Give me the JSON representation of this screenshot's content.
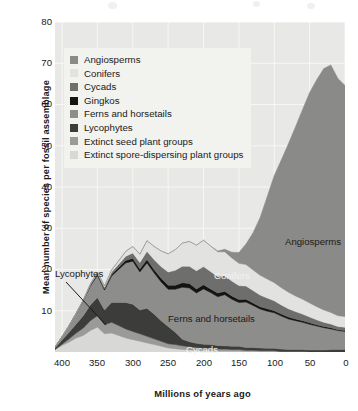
{
  "chart_data": {
    "type": "area",
    "stacked": true,
    "title": "",
    "xlabel": "Millions of years ago",
    "ylabel": "Mean number of species per fossil assemblage",
    "xlim": [
      410,
      0
    ],
    "ylim": [
      0,
      80
    ],
    "x_ticks": [
      "400",
      "350",
      "300",
      "250",
      "200",
      "150",
      "100",
      "50",
      "0"
    ],
    "x_tick_values": [
      400,
      350,
      300,
      250,
      200,
      150,
      100,
      50,
      0
    ],
    "y_ticks": [
      "10",
      "20",
      "30",
      "40",
      "50",
      "60",
      "70",
      "80"
    ],
    "y_tick_values": [
      10,
      20,
      30,
      40,
      50,
      60,
      70,
      80
    ],
    "x_axis_inverted": true,
    "grid": true,
    "grid_color": "#f7f7f5",
    "plot_background": "#e8e8e6",
    "legend_position": "upper-left-inside",
    "x": [
      410,
      400,
      390,
      380,
      370,
      360,
      350,
      340,
      330,
      320,
      310,
      300,
      290,
      280,
      270,
      260,
      250,
      240,
      230,
      220,
      210,
      200,
      190,
      180,
      170,
      160,
      150,
      140,
      130,
      120,
      110,
      100,
      90,
      80,
      70,
      60,
      50,
      40,
      30,
      20,
      10,
      0
    ],
    "series": [
      {
        "name": "Extinct spore-dispersing plant groups",
        "color": "#d8d8d6",
        "values": [
          0.6,
          1.6,
          2.4,
          3.4,
          4.0,
          5.2,
          6.0,
          4.4,
          4.6,
          4.0,
          3.4,
          3.0,
          2.6,
          2.2,
          1.8,
          1.4,
          1.0,
          0.8,
          0.6,
          0.5,
          0.4,
          0.3,
          0.3,
          0.2,
          0.2,
          0.2,
          0.2,
          0.1,
          0.1,
          0.1,
          0.1,
          0.1,
          0.0,
          0.0,
          0.0,
          0.0,
          0.0,
          0.0,
          0.0,
          0.0,
          0.0,
          0.0
        ]
      },
      {
        "name": "Extinct seed plant groups",
        "color": "#9a9a98",
        "values": [
          0.0,
          0.3,
          0.8,
          1.2,
          1.8,
          2.4,
          2.8,
          2.2,
          2.6,
          2.4,
          2.2,
          2.0,
          1.8,
          1.6,
          1.4,
          1.2,
          1.0,
          1.0,
          0.9,
          0.8,
          0.7,
          0.6,
          0.6,
          0.5,
          0.5,
          0.4,
          0.4,
          0.3,
          0.3,
          0.2,
          0.2,
          0.2,
          0.1,
          0.1,
          0.1,
          0.1,
          0.0,
          0.0,
          0.0,
          0.0,
          0.0,
          0.0
        ]
      },
      {
        "name": "Lycophytes",
        "color": "#3c3c3a",
        "values": [
          0.4,
          1.0,
          1.6,
          2.2,
          3.0,
          3.8,
          4.4,
          3.6,
          4.8,
          5.6,
          6.4,
          6.6,
          5.8,
          6.8,
          6.0,
          5.0,
          4.2,
          3.0,
          1.6,
          1.2,
          1.0,
          1.0,
          0.9,
          0.9,
          0.8,
          0.8,
          0.8,
          0.7,
          0.7,
          0.7,
          0.6,
          0.6,
          0.6,
          0.5,
          0.5,
          0.5,
          0.5,
          0.5,
          0.5,
          0.6,
          0.6,
          0.6
        ]
      },
      {
        "name": "Ferns and horsetails",
        "color": "#8d8d8b",
        "values": [
          0.2,
          0.8,
          1.6,
          2.6,
          3.6,
          4.6,
          5.4,
          4.8,
          6.4,
          8.0,
          9.6,
          10.4,
          9.2,
          11.0,
          10.0,
          9.4,
          9.0,
          10.4,
          12.6,
          13.0,
          12.2,
          13.4,
          12.6,
          11.8,
          12.4,
          11.4,
          10.6,
          11.0,
          10.2,
          9.4,
          9.0,
          8.6,
          8.0,
          7.4,
          7.0,
          6.6,
          6.2,
          5.8,
          5.4,
          5.0,
          4.6,
          4.4
        ]
      },
      {
        "name": "Gingkos",
        "color": "#141412",
        "values": [
          0.0,
          0.0,
          0.0,
          0.0,
          0.1,
          0.2,
          0.3,
          0.3,
          0.4,
          0.5,
          0.6,
          0.7,
          0.7,
          0.8,
          0.8,
          0.9,
          1.0,
          1.0,
          1.1,
          1.1,
          1.0,
          1.0,
          0.9,
          0.9,
          0.8,
          0.8,
          0.7,
          0.7,
          0.6,
          0.6,
          0.6,
          0.5,
          0.5,
          0.5,
          0.4,
          0.4,
          0.4,
          0.3,
          0.3,
          0.3,
          0.2,
          0.2
        ]
      },
      {
        "name": "Cycads",
        "color": "#6e6e6c",
        "values": [
          0.0,
          0.0,
          0.0,
          0.0,
          0.1,
          0.2,
          0.3,
          0.4,
          0.6,
          0.8,
          1.0,
          1.3,
          1.6,
          2.0,
          2.4,
          2.8,
          3.2,
          3.6,
          4.0,
          4.2,
          4.4,
          4.4,
          4.2,
          4.0,
          3.8,
          3.6,
          3.4,
          3.2,
          3.0,
          2.8,
          2.6,
          2.4,
          2.2,
          2.0,
          1.8,
          1.6,
          1.4,
          1.2,
          1.0,
          0.9,
          0.8,
          0.8
        ]
      },
      {
        "name": "Conifers",
        "color": "#e2e2e0",
        "values": [
          0.0,
          0.0,
          0.0,
          0.0,
          0.0,
          0.1,
          0.2,
          0.3,
          0.5,
          0.8,
          1.2,
          1.6,
          2.0,
          2.6,
          3.2,
          3.8,
          4.4,
          5.0,
          5.6,
          6.0,
          6.2,
          6.4,
          6.2,
          6.0,
          5.8,
          5.6,
          5.4,
          5.2,
          5.0,
          4.8,
          4.6,
          4.4,
          4.2,
          4.0,
          3.8,
          3.6,
          3.4,
          3.2,
          3.0,
          2.8,
          2.6,
          2.6
        ]
      },
      {
        "name": "Angiosperms",
        "color": "#8a8a88",
        "values": [
          0.0,
          0.0,
          0.0,
          0.0,
          0.0,
          0.0,
          0.0,
          0.0,
          0.0,
          0.0,
          0.0,
          0.0,
          0.0,
          0.0,
          0.0,
          0.0,
          0.0,
          0.0,
          0.0,
          0.0,
          0.0,
          0.0,
          0.0,
          0.2,
          0.6,
          1.4,
          2.6,
          5.0,
          9.0,
          14.0,
          20.0,
          26.0,
          31.0,
          36.0,
          41.0,
          46.0,
          51.0,
          55.0,
          58.5,
          60.0,
          57.5,
          56.0
        ]
      }
    ],
    "annotations": [
      {
        "text": "Angiosperms",
        "x": 285,
        "y": 236,
        "tone": "dark"
      },
      {
        "text": "Conifers",
        "x": 214,
        "y": 270,
        "tone": "light"
      },
      {
        "text": "Ferns and horsetails",
        "x": 168,
        "y": 313,
        "tone": "dark"
      },
      {
        "text": "Cycads",
        "x": 186,
        "y": 344,
        "tone": "light"
      },
      {
        "text": "Lycophytes",
        "x": 55,
        "y": 268,
        "tone": "dark"
      }
    ]
  },
  "legend": {
    "items": [
      {
        "label": "Angiosperms",
        "color": "#8a8a88"
      },
      {
        "label": "Conifers",
        "color": "#e2e2e0"
      },
      {
        "label": "Cycads",
        "color": "#6e6e6c"
      },
      {
        "label": "Gingkos",
        "color": "#141412"
      },
      {
        "label": "Ferns and horsetails",
        "color": "#8d8d8b"
      },
      {
        "label": "Lycophytes",
        "color": "#3c3c3a"
      },
      {
        "label": "Extinct seed plant groups",
        "color": "#9a9a98"
      },
      {
        "label": "Extinct spore-dispersing plant groups",
        "color": "#d8d8d6"
      }
    ]
  }
}
